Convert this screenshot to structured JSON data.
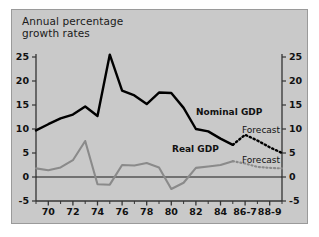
{
  "figure": {
    "title": "Annual percentage\ngrowth rates",
    "title_line1": "Annual percentage",
    "title_line2": "growth rates",
    "background_color": "#c9c9c9",
    "page_color": "#ffffff",
    "nominal_color": "#000000",
    "real_color": "#8a8a8a",
    "axis_color": "#333333"
  },
  "labels": {
    "nominal_series": "Nominal GDP",
    "real_series": "Real GDP",
    "forecast_nominal": "Forecast",
    "forecast_real": "Forecast"
  },
  "chart_data": {
    "type": "line",
    "title": "Annual percentage growth rates",
    "xlabel": "",
    "ylabel": "",
    "ylim": [
      -5,
      25
    ],
    "yticks": [
      -5,
      0,
      5,
      10,
      15,
      20,
      25
    ],
    "y_axis_left_ticks": [
      "-5",
      "0",
      "5",
      "10",
      "15",
      "20",
      "25"
    ],
    "y_axis_right_ticks": [
      "-5",
      "0",
      "5",
      "10",
      "15",
      "20",
      "25"
    ],
    "grid": false,
    "zero_line": true,
    "legend": "inline-annotations",
    "x": [
      1969,
      1970,
      1971,
      1972,
      1973,
      1974,
      1975,
      1976,
      1977,
      1978,
      1979,
      1980,
      1981,
      1982,
      1983,
      1984,
      1985,
      1986,
      1987,
      1988,
      1989
    ],
    "xticks": [
      1970,
      1972,
      1974,
      1976,
      1978,
      1980,
      1982,
      1984,
      1986,
      1988
    ],
    "xticklabels": [
      "70",
      "72",
      "74",
      "76",
      "78",
      "80",
      "82",
      "84",
      "86-7",
      "88-9"
    ],
    "series": [
      {
        "name": "Nominal GDP",
        "color": "#000000",
        "style": "solid",
        "x": [
          1969,
          1970,
          1971,
          1972,
          1973,
          1974,
          1975,
          1976,
          1977,
          1978,
          1979,
          1980,
          1981,
          1982,
          1983
        ],
        "values": [
          9.7,
          11.0,
          12.2,
          13.0,
          14.7,
          12.7,
          25.5,
          18.0,
          17.0,
          15.2,
          17.6,
          17.5,
          14.4,
          10.0,
          9.5
        ]
      },
      {
        "name": "Nominal GDP (continued)",
        "color": "#000000",
        "style": "solid",
        "x": [
          1983,
          1984,
          1985
        ],
        "values": [
          9.5,
          8.0,
          6.7
        ]
      },
      {
        "name": "Nominal GDP Forecast",
        "color": "#000000",
        "style": "dotted",
        "x": [
          1985,
          1986,
          1987,
          1988,
          1989
        ],
        "values": [
          6.7,
          8.8,
          7.6,
          6.2,
          5.0
        ]
      },
      {
        "name": "Real GDP",
        "color": "#8a8a8a",
        "style": "solid",
        "x": [
          1969,
          1970,
          1971,
          1972,
          1973,
          1974,
          1975,
          1976,
          1977,
          1978,
          1979,
          1980,
          1981,
          1982,
          1983,
          1984,
          1985
        ],
        "values": [
          1.8,
          1.4,
          2.0,
          3.5,
          7.5,
          -1.5,
          -1.6,
          2.5,
          2.4,
          2.9,
          2.0,
          -2.5,
          -1.2,
          1.9,
          2.2,
          2.5,
          3.3
        ]
      },
      {
        "name": "Real GDP Forecast",
        "color": "#8a8a8a",
        "style": "dotted",
        "x": [
          1985,
          1986,
          1987,
          1988,
          1989
        ],
        "values": [
          3.3,
          2.8,
          2.1,
          1.9,
          1.8
        ]
      }
    ]
  }
}
